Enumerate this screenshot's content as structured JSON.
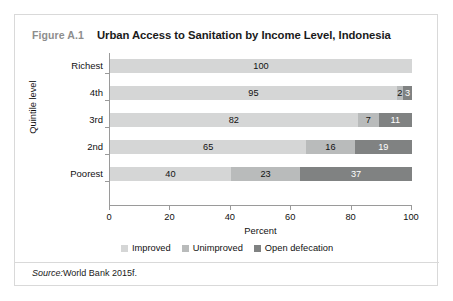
{
  "figure": {
    "number": "Figure A.1",
    "title": "Urban Access to Sanitation by Income Level, Indonesia",
    "source_word": "Source:",
    "source_text": "World Bank 2015f."
  },
  "chart_data": {
    "type": "bar",
    "orientation": "horizontal",
    "stacked": true,
    "stack_mode": "percent",
    "title": "Urban Access to Sanitation by Income Level, Indonesia",
    "xlabel": "Percent",
    "ylabel": "Quintile level",
    "xlim": [
      0,
      100
    ],
    "xticks": [
      0,
      20,
      40,
      60,
      80,
      100
    ],
    "xtick_labels": [
      "0",
      "20",
      "40",
      "60",
      "80",
      "100"
    ],
    "grid": false,
    "legend_position": "bottom-center",
    "categories": [
      "Poorest",
      "2nd",
      "3rd",
      "4th",
      "Richest"
    ],
    "category_order_top_to_bottom": [
      "Richest",
      "4th",
      "3rd",
      "2nd",
      "Poorest"
    ],
    "series": [
      {
        "name": "Improved",
        "color": "#d5d6d6",
        "values": [
          40,
          65,
          82,
          95,
          100
        ],
        "labels": [
          "40",
          "65",
          "82",
          "95",
          "100"
        ]
      },
      {
        "name": "Unimproved",
        "color": "#b9bbbb",
        "values": [
          23,
          16,
          7,
          2,
          0
        ],
        "labels": [
          "23",
          "16",
          "7",
          "2",
          ""
        ]
      },
      {
        "name": "Open defecation",
        "color": "#808282",
        "values": [
          37,
          19,
          11,
          3,
          0
        ],
        "labels": [
          "37",
          "19",
          "11",
          "3",
          ""
        ]
      }
    ],
    "rows": [
      {
        "category": "Richest",
        "segments": [
          {
            "series": "Improved",
            "value": 100,
            "label": "100",
            "label_on_dark": false
          }
        ]
      },
      {
        "category": "4th",
        "segments": [
          {
            "series": "Improved",
            "value": 95,
            "label": "95",
            "label_on_dark": false
          },
          {
            "series": "Unimproved",
            "value": 2,
            "label": "2",
            "label_on_dark": false
          },
          {
            "series": "Open defecation",
            "value": 3,
            "label": "3",
            "label_on_dark": true
          }
        ]
      },
      {
        "category": "3rd",
        "segments": [
          {
            "series": "Improved",
            "value": 82,
            "label": "82",
            "label_on_dark": false
          },
          {
            "series": "Unimproved",
            "value": 7,
            "label": "7",
            "label_on_dark": false
          },
          {
            "series": "Open defecation",
            "value": 11,
            "label": "11",
            "label_on_dark": true
          }
        ]
      },
      {
        "category": "2nd",
        "segments": [
          {
            "series": "Improved",
            "value": 65,
            "label": "65",
            "label_on_dark": false
          },
          {
            "series": "Unimproved",
            "value": 16,
            "label": "16",
            "label_on_dark": false
          },
          {
            "series": "Open defecation",
            "value": 19,
            "label": "19",
            "label_on_dark": true
          }
        ]
      },
      {
        "category": "Poorest",
        "segments": [
          {
            "series": "Improved",
            "value": 40,
            "label": "40",
            "label_on_dark": false
          },
          {
            "series": "Unimproved",
            "value": 23,
            "label": "23",
            "label_on_dark": false
          },
          {
            "series": "Open defecation",
            "value": 37,
            "label": "37",
            "label_on_dark": true
          }
        ]
      }
    ]
  },
  "colors": {
    "improved": "#d5d6d6",
    "unimproved": "#b9bbbb",
    "open_defecation": "#808282",
    "axis": "#9a9a9a",
    "card_border": "#d9d9d9",
    "figure_number": "#8d8d8d",
    "text": "#111111"
  }
}
